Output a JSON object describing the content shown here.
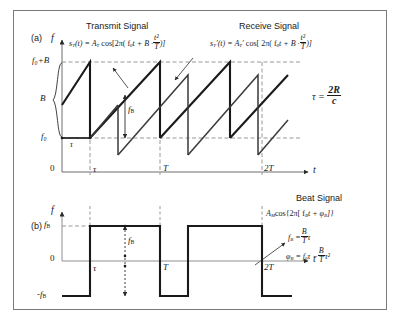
{
  "figure": {
    "type": "fmcw-radar-timing-diagram",
    "panels": [
      {
        "tag": "(a)",
        "y_axis_label": "f",
        "x_axis_label": "t",
        "y_ticks": [
          "f0+B",
          "B",
          "f0"
        ],
        "x_ticks": [
          "0",
          "τ",
          "T",
          "2T"
        ],
        "annotations": [
          "f B"
        ]
      },
      {
        "tag": "(b)",
        "y_axis_label": "f",
        "x_axis_label": "t",
        "y_ticks": [
          "fB",
          "0",
          "-fB"
        ],
        "x_ticks": [
          "τ",
          "T",
          "2T"
        ],
        "annotations": [
          "f B"
        ]
      }
    ]
  },
  "titles": {
    "transmit": "Transmit Signal",
    "receive": "Receive Signal",
    "beat": "Beat Signal"
  },
  "panel_a": {
    "tag": "(a)",
    "axis_f": "f",
    "axis_t": "t",
    "tick_f0_plus_B": "f₀+B",
    "tick_B": "B",
    "tick_f0": "f₀",
    "tick_zero": "0",
    "tick_tau": "τ",
    "tick_T": "T",
    "tick_2T": "2T",
    "tau_small": "τ",
    "fb_arrow_label": "f",
    "fb_arrow_sub": "B"
  },
  "panel_b": {
    "tag": "(b)",
    "axis_f": "f",
    "axis_t": "t",
    "tick_fB": "f",
    "tick_fB_sub": "B",
    "tick_zero": "0",
    "tick_neg_fB": "-f",
    "tick_neg_fB_sub": "B",
    "tick_tau": "τ",
    "tick_T": "T",
    "tick_2T": "2T",
    "fb_arrow_label": "f",
    "fb_arrow_sub": "B"
  },
  "equations": {
    "transmit_lhs": "s",
    "transmit_lhs_sub": "T",
    "transmit_body": "(t) = A",
    "transmit_amp_sub": "T",
    "transmit_cos": "cos[2π( f",
    "transmit_f0_sub": "0",
    "transmit_mid": "t + B ·",
    "transmit_frac_num": "t²",
    "transmit_frac_den": "T",
    "transmit_tail": ")]",
    "receive_lhs": "s",
    "receive_lhs_sub": "T",
    "receive_prime": "′",
    "receive_body": "(t) = A",
    "receive_amp_sub": "T",
    "receive_amp_prime": "′",
    "receive_cos": "cos[ 2π( f",
    "receive_f0_sub": "0",
    "receive_mid": "t + B ·",
    "receive_frac_num": "t²",
    "receive_frac_den": "T",
    "receive_tail": ")]",
    "tau_lhs": "τ =",
    "tau_num": "2R",
    "tau_den": "c",
    "beat_main": "A",
    "beat_main_sub": "M",
    "beat_cos": "cos{2π[ f",
    "beat_f_sub": "B",
    "beat_mid": "t + φ",
    "beat_phi_sub": "B",
    "beat_tail": "]}",
    "fb_lhs": "f",
    "fb_lhs_sub": "B",
    "fb_eq": "=",
    "fb_num": "B",
    "fb_den": "T",
    "fb_tail": "τ",
    "phi_lhs": "φ",
    "phi_lhs_sub": "B",
    "phi_eq": "= f",
    "phi_f0_sub": "0",
    "phi_mid": "τ −",
    "phi_num": "B",
    "phi_den": "T",
    "phi_tail": "τ²"
  },
  "colors": {
    "frame": "#7a7a7a",
    "transmit_wave": "#1a1a1a",
    "receive_wave": "#3a3a3a",
    "dashed_guide": "#8c8c8c",
    "axis": "#6e6e6e",
    "text": "#1a1a1a",
    "arrow": "#2b2b2b"
  }
}
